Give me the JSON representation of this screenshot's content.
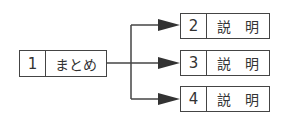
{
  "diagram": {
    "source": {
      "number": "1",
      "label": "まとめ"
    },
    "targets": [
      {
        "number": "2",
        "label": "説　明"
      },
      {
        "number": "3",
        "label": "説　明"
      },
      {
        "number": "4",
        "label": "説　明"
      }
    ],
    "line_color": "#444444"
  }
}
